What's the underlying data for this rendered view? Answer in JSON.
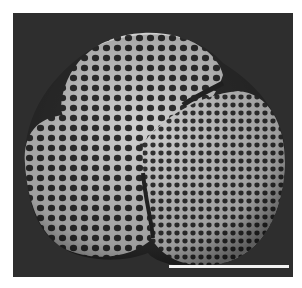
{
  "image": {
    "description": "Scanning electron micrograph of a reticulate, tricolpate pollen grain on a dark background",
    "background_color": "#2e2e2e",
    "surface_color": "#c9c9c9",
    "lumina_color": "#3a3a3a"
  },
  "scale_bar": {
    "color": "#f2f2f2",
    "left_px": 169,
    "top_px": 265,
    "width_px": 120,
    "label": ""
  }
}
